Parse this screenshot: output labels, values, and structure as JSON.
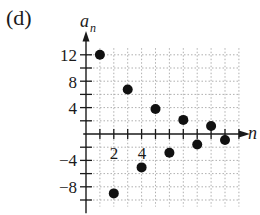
{
  "panel_label": "(d)",
  "chart_data": {
    "type": "scatter",
    "title": "",
    "xlabel": "n",
    "ylabel": "a_n",
    "x": [
      1,
      2,
      3,
      4,
      5,
      6,
      7,
      8,
      9,
      10
    ],
    "values": [
      12,
      -9,
      6.75,
      -5.06,
      3.8,
      -2.85,
      2.14,
      -1.6,
      1.2,
      -0.9
    ],
    "x_ticks": [
      2,
      4
    ],
    "y_ticks": [
      -8,
      -4,
      4,
      8,
      12
    ],
    "xlim": [
      0,
      11
    ],
    "ylim": [
      -11,
      14
    ],
    "grid": true,
    "legend": null
  },
  "axes": {
    "x_label": "n",
    "y_label_main": "a",
    "y_label_sub": "n",
    "x_tick_labels": [
      "2",
      "4"
    ],
    "y_tick_labels": [
      "12",
      "8",
      "4",
      "−4",
      "−8"
    ]
  },
  "colors": {
    "axis": "#1a1a1a",
    "grid": "#9a9a9a",
    "point": "#111111",
    "background": "#ffffff"
  }
}
